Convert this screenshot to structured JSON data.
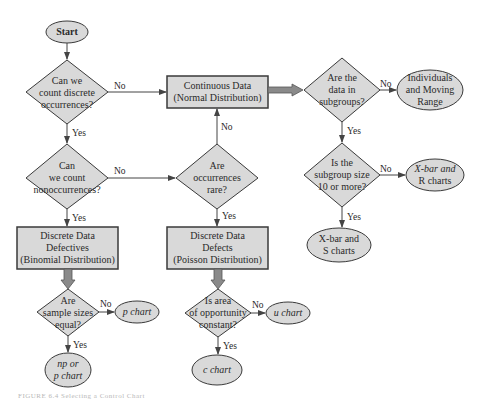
{
  "nodes": {
    "start": "Start",
    "q_discrete": [
      "Can we",
      "count discrete",
      "occurrences?"
    ],
    "continuous": [
      "Continuous Data",
      "(Normal Distribution)"
    ],
    "q_subgroups": [
      "Are the",
      "data in",
      "subgroups?"
    ],
    "individuals": [
      "Individuals",
      "and Moving",
      "Range"
    ],
    "q_nonoccur": [
      "Can",
      "we count",
      "nonoccurrences?"
    ],
    "q_rare": [
      "Are",
      "occurrences",
      "rare?"
    ],
    "q_size10": [
      "Is the",
      "subgroup size",
      "10 or more?"
    ],
    "xbar_r": [
      "X-bar and",
      "R charts"
    ],
    "xbar_s": [
      "X-bar and",
      "S charts"
    ],
    "defectives": [
      "Discrete Data",
      "Defectives",
      "(Binomial Distribution)"
    ],
    "defects": [
      "Discrete Data",
      "Defects",
      "(Poisson Distribution)"
    ],
    "q_equal": [
      "Are",
      "sample sizes",
      "equal?"
    ],
    "p_chart": "p chart",
    "np_chart": [
      "np or",
      "p chart"
    ],
    "q_area": [
      "Is area",
      "of opportunity",
      "constant?"
    ],
    "u_chart": "u chart",
    "c_chart": "c chart"
  },
  "edges": {
    "yes": "Yes",
    "no": "No"
  },
  "colors": {
    "fill": "#d9d9d9",
    "stroke": "#3a3a3a",
    "arrow": "#555555"
  },
  "caption": "FIGURE 6.4  Selecting a Control Chart"
}
